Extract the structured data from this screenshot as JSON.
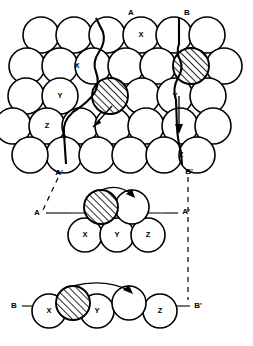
{
  "figure": {
    "background_color": "#ffffff",
    "line_color": "#000000",
    "width": 253,
    "height": 346
  },
  "labels": {
    "section_a_top": "A",
    "section_a_prime_top": "A'",
    "section_b_top": "B",
    "section_b_prime_top": "B'",
    "section_a_left": "A",
    "section_a_prime_right": "A'",
    "section_b_left": "B",
    "section_b_prime_right": "B'"
  },
  "plan_view": {
    "name": "top-plan-view",
    "atom_labels": [
      {
        "text": "X",
        "cx": 141,
        "cy": 35
      },
      {
        "text": "X",
        "cx": 77,
        "cy": 66
      },
      {
        "text": "Y",
        "cx": 60,
        "cy": 96
      },
      {
        "text": "Y",
        "cx": 175,
        "cy": 96
      },
      {
        "text": "Z",
        "cx": 47,
        "cy": 126
      },
      {
        "text": "Z",
        "cx": 181,
        "cy": 155
      }
    ],
    "rows": [
      {
        "y": 35,
        "x_start": 41,
        "count": 6,
        "spacing": 33
      },
      {
        "y": 66,
        "x_start": 27,
        "count": 7,
        "spacing": 33
      },
      {
        "y": 96,
        "x_start": 26,
        "count": 7,
        "spacing": 33
      },
      {
        "y": 126,
        "x_start": 13,
        "count": 7,
        "spacing": 33
      },
      {
        "y": 155,
        "x_start": 44,
        "count": 6,
        "spacing": 33
      }
    ],
    "hatched_atoms": [
      {
        "cx": 110,
        "cy": 96,
        "r": 18
      },
      {
        "cx": 191,
        "cy": 66,
        "r": 18
      }
    ],
    "radius": 18
  },
  "section_aa": {
    "name": "section-a-a-prime",
    "base_atoms": [
      {
        "text": "X",
        "cx": 85,
        "cy": 235
      },
      {
        "text": "Y",
        "cx": 117,
        "cy": 235
      },
      {
        "text": "Z",
        "cx": 148,
        "cy": 235
      }
    ],
    "hatched_atom": {
      "cx": 101,
      "cy": 207
    },
    "open_atom": {
      "cx": 132,
      "cy": 207
    },
    "baseline_y": 213,
    "radius": 17
  },
  "section_bb": {
    "name": "section-b-b-prime",
    "base_atoms": [
      {
        "text": "X",
        "cx": 49,
        "cy": 311
      },
      {
        "text": "Y",
        "cx": 97,
        "cy": 311
      },
      {
        "text": "Z",
        "cx": 160,
        "cy": 311
      }
    ],
    "hatched_atom": {
      "cx": 73,
      "cy": 303
    },
    "open_atom": {
      "cx": 129,
      "cy": 303
    },
    "baseline_y": 306,
    "radius": 17
  },
  "annotations": {
    "jump_arrow_plan_left": "arrow-jump-left",
    "jump_arrow_plan_right": "arrow-jump-right",
    "jump_arrow_section_aa": "arrow-jump-section-aa",
    "jump_arrow_section_bb": "arrow-jump-section-bb"
  }
}
